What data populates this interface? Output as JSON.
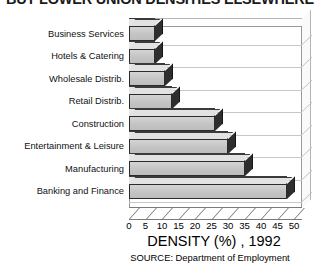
{
  "chart_data": {
    "type": "bar",
    "orientation": "horizontal",
    "title": "BUT LOWER UNION DENSITIES ELSEWHERE",
    "xlabel": "DENSITY (%) , 1992",
    "ylabel": "",
    "source": "SOURCE: Department of Employment",
    "categories": [
      "Business Services",
      "Hotels & Catering",
      "Wholesale Distrib.",
      "Retail Distrib.",
      "Construction",
      "Entertainment & Leisure",
      "Manufacturing",
      "Banking and Finance"
    ],
    "values": [
      8,
      8,
      11,
      13,
      26,
      30,
      35,
      48
    ],
    "xlim": [
      0,
      50
    ],
    "xticks": [
      0,
      5,
      10,
      15,
      20,
      25,
      30,
      35,
      40,
      45,
      50
    ],
    "xtick_labels": [
      "0",
      "5",
      "10",
      "15",
      "20",
      "25",
      "30",
      "35",
      "40",
      "45",
      "50"
    ],
    "grid": true,
    "legend": false,
    "style": "3d",
    "bar_color": "#c9c9c9",
    "bar_edge_color": "#2b2b2b",
    "frame_color": "#9a9a9a"
  }
}
